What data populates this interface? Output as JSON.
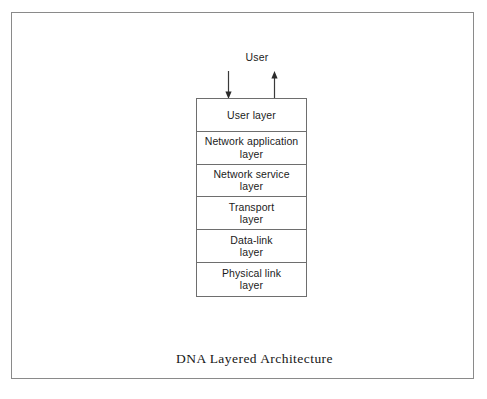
{
  "diagram": {
    "caption": "DNA Layered Architecture",
    "external_actor": {
      "label": "User"
    },
    "connectors": [
      {
        "name": "downward-arrow",
        "direction": "down",
        "from": "User",
        "to": "User layer"
      },
      {
        "name": "upward-arrow",
        "direction": "up",
        "from": "User layer",
        "to": "User"
      }
    ],
    "layers": [
      {
        "label": "User layer",
        "lines": [
          "User layer"
        ]
      },
      {
        "label": "Network application layer",
        "lines": [
          "Network application",
          "layer"
        ]
      },
      {
        "label": "Network service layer",
        "lines": [
          "Network service",
          "layer"
        ]
      },
      {
        "label": "Transport layer",
        "lines": [
          "Transport",
          "layer"
        ]
      },
      {
        "label": "Data-link layer",
        "lines": [
          "Data-link",
          "layer"
        ]
      },
      {
        "label": "Physical link layer",
        "lines": [
          "Physical link",
          "layer"
        ]
      }
    ],
    "colors": {
      "page_background": "#ffffff",
      "frame_border": "#8a8a8a",
      "box_border": "#6e6e6e",
      "text": "#1b1b1b",
      "caption_text": "#161616"
    }
  }
}
